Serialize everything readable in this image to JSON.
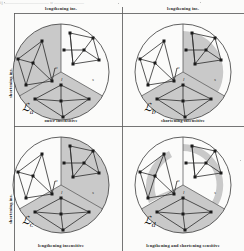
{
  "figure": {
    "title_residue": "ij          —————————          o          ——————",
    "axis": {
      "top_left": "lengthening ins.",
      "top_right": "lengthening ins.",
      "left_upper": "shortening ins.",
      "left_lower": "shortening ins."
    },
    "dividers": {
      "vertical_x": 122,
      "horizontal_y": 126
    }
  },
  "panels": [
    {
      "id": "panel-a",
      "label": "ℒ",
      "sub": "a",
      "caption_top": "lengthening ins.",
      "caption_bottom": "outer insensitive",
      "sector_labels": [
        "o",
        "l",
        "s"
      ],
      "shaded_sectors": [
        "left",
        "bottom"
      ],
      "shading_mode": "sectors",
      "shade_color": "#c9c9c9"
    },
    {
      "id": "panel-b",
      "label": "ℒ",
      "sub": "b",
      "caption_top": "lengthening ins.",
      "caption_bottom": "shortening insensitive",
      "sector_labels": [
        "o",
        "l",
        "s"
      ],
      "shaded_sectors": [
        "right-partial",
        "bottom"
      ],
      "shading_mode": "partial",
      "shade_color": "#c9c9c9"
    },
    {
      "id": "panel-c",
      "label": "ℒ",
      "sub": "c",
      "caption_top": "outer insensitive",
      "caption_bottom": "lengthening insensitive",
      "sector_labels": [
        "o",
        "l",
        "s"
      ],
      "shaded_sectors": [
        "right",
        "bottom"
      ],
      "shading_mode": "sectors",
      "shade_color": "#c9c9c9"
    },
    {
      "id": "panel-d",
      "label": "ℒ",
      "sub": "d",
      "caption_top": "shortening insensitive",
      "caption_bottom": "lengthening and shortening sensitive",
      "sector_labels": [
        "o",
        "l",
        "s"
      ],
      "shaded_sectors": [
        "left-band",
        "right-band",
        "bottom"
      ],
      "shading_mode": "bands",
      "shade_color": "#c9c9c9"
    }
  ],
  "graph": {
    "node_count_per_sector": 8,
    "node_labels": [
      "a",
      "b",
      "c",
      "d",
      "e",
      "f",
      "g",
      "h"
    ],
    "node_color": "#1b1b1b",
    "edge_color": "#2b2b2b",
    "circle_stroke": "#3a3a3a"
  }
}
